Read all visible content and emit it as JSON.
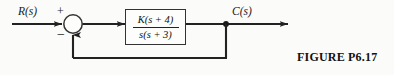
{
  "figure": {
    "caption": "FIGURE  P6.17",
    "background_color": "#fbfbf9",
    "line_color": "#222222"
  },
  "diagram": {
    "type": "block-diagram",
    "input_label": "R(s)",
    "output_label": "C(s)",
    "summing_junction": {
      "positive_sign": "+",
      "negative_sign": "−"
    },
    "forward_block": {
      "numerator": "K(s + 4)",
      "denominator": "s(s + 3)"
    },
    "feedback_path": {
      "gain": "1",
      "unity": true
    }
  }
}
